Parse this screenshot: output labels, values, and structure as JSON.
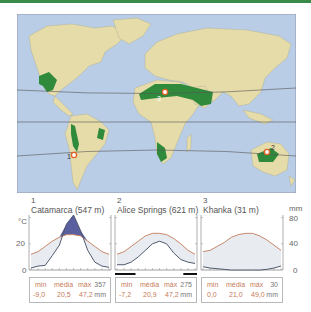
{
  "colors": {
    "top_bar": "#3a8a4a",
    "ocean": "#b9cde6",
    "land": "#e6dcaa",
    "desert": "#2f8a3c",
    "temp_line": "#c8876a",
    "precip_line": "#505a6e",
    "dry_fill": "#e8ecf0",
    "wet_fill": "#5a5fa0",
    "marker": "#e0642a"
  },
  "map": {
    "markers": [
      {
        "id": "1",
        "label": "1"
      },
      {
        "id": "2",
        "label": "2"
      },
      {
        "id": "3",
        "label": "3"
      }
    ]
  },
  "axes": {
    "left_unit": "°C",
    "right_unit": "mm",
    "left_ticks": [
      "20",
      "0"
    ],
    "right_ticks": [
      "80",
      "40",
      "0"
    ]
  },
  "stations": [
    {
      "number": "1",
      "title": "Catamarca (547 m)",
      "stats": {
        "min_label": "min",
        "avg_label": "média",
        "max_label": "máx",
        "min": "-9,0",
        "avg": "20,5",
        "max": "47,2",
        "precip": "357",
        "unit": "mm"
      }
    },
    {
      "number": "2",
      "title": "Alice Springs (621 m)",
      "stats": {
        "min_label": "min",
        "avg_label": "média",
        "max_label": "máx",
        "min": "-7,2",
        "avg": "20,9",
        "max": "47,2",
        "precip": "275",
        "unit": "mm"
      }
    },
    {
      "number": "3",
      "title": "Khanka (31 m)",
      "stats": {
        "min_label": "min",
        "avg_label": "média",
        "max_label": "máx",
        "min": "0,0",
        "avg": "21,0",
        "max": "49,0",
        "precip": "30",
        "unit": "mm"
      }
    }
  ],
  "chart_data": [
    {
      "type": "line",
      "title": "1 Catamarca (547 m)",
      "x": [
        "Jul",
        "Aug",
        "Sep",
        "Oct",
        "Nov",
        "Dec",
        "Jan",
        "Feb",
        "Mar",
        "Apr",
        "May",
        "Jun"
      ],
      "series": [
        {
          "name": "Temperatura (°C)",
          "axis": "left",
          "values": [
            12,
            14,
            18,
            22,
            25,
            27,
            27,
            26,
            22,
            18,
            14,
            12
          ]
        },
        {
          "name": "Precipitação (mm)",
          "axis": "right",
          "values": [
            3,
            6,
            7,
            22,
            38,
            70,
            84,
            60,
            30,
            12,
            6,
            4
          ]
        }
      ],
      "ylabel": "°C",
      "y2label": "mm",
      "ylim": [
        0,
        40
      ],
      "y2lim": [
        0,
        80
      ]
    },
    {
      "type": "line",
      "title": "2 Alice Springs (621 m)",
      "x": [
        "Jul",
        "Aug",
        "Sep",
        "Oct",
        "Nov",
        "Dec",
        "Jan",
        "Feb",
        "Mar",
        "Apr",
        "May",
        "Jun"
      ],
      "series": [
        {
          "name": "Temperatura (°C)",
          "axis": "left",
          "values": [
            12,
            14,
            18,
            22,
            26,
            28,
            28,
            27,
            24,
            20,
            15,
            12
          ]
        },
        {
          "name": "Precipitação (mm)",
          "axis": "right",
          "values": [
            8,
            8,
            12,
            20,
            30,
            40,
            44,
            40,
            26,
            16,
            12,
            10
          ]
        }
      ],
      "dry_season_bars": [
        [
          0,
          3
        ],
        [
          10,
          12
        ]
      ],
      "ylabel": "°C",
      "y2label": "mm",
      "ylim": [
        0,
        40
      ],
      "y2lim": [
        0,
        80
      ]
    },
    {
      "type": "line",
      "title": "3 Khanka (31 m)",
      "x": [
        "Jan",
        "Feb",
        "Mar",
        "Apr",
        "May",
        "Jun",
        "Jul",
        "Aug",
        "Sep",
        "Oct",
        "Nov",
        "Dec"
      ],
      "series": [
        {
          "name": "Temperatura (°C)",
          "axis": "left",
          "values": [
            14,
            15,
            18,
            21,
            25,
            27,
            28,
            28,
            26,
            23,
            19,
            15
          ]
        },
        {
          "name": "Precipitação (mm)",
          "axis": "right",
          "values": [
            5,
            3,
            2,
            1,
            0,
            0,
            0,
            0,
            0,
            1,
            3,
            6
          ]
        }
      ],
      "ylabel": "°C",
      "y2label": "mm",
      "ylim": [
        0,
        40
      ],
      "y2lim": [
        0,
        80
      ]
    }
  ]
}
